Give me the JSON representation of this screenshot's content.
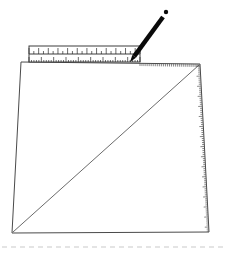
{
  "figure": {
    "title": "Perspective square construction with ruler and pencil",
    "caption": "",
    "background_color": "#ffffff",
    "width": 225,
    "height": 254
  },
  "colors": {
    "outline": "#4a4a4a",
    "diagonal": "#6b6b6b",
    "ruler_body": "#ffffff",
    "ruler_stroke": "#3d3d3d",
    "ruler_tick": "#2b2b2b",
    "pencil": "#0a0a0a",
    "edge_ticks": "#555555",
    "baseline_dash": "#c9c9c9"
  },
  "shapes": {
    "quadrilateral": {
      "label": "perspective-square",
      "points": [
        {
          "name": "top-left",
          "x": 21,
          "y": 62
        },
        {
          "name": "top-right",
          "x": 200,
          "y": 64
        },
        {
          "name": "bottom-right",
          "x": 209,
          "y": 232
        },
        {
          "name": "bottom-left",
          "x": 12,
          "y": 233
        }
      ],
      "stroke_width": 1
    },
    "diagonal": {
      "label": "corner-to-corner-diagonal",
      "from": {
        "name": "bottom-left",
        "x": 13,
        "y": 232
      },
      "to": {
        "name": "top-right",
        "x": 199,
        "y": 65
      },
      "stroke_width": 1
    },
    "baseline_dashes": {
      "label": "ground-line",
      "y": 247,
      "x_start": 2,
      "x_end": 223,
      "dash": "5 4",
      "stroke_width": 1
    }
  },
  "ruler": {
    "label": "ruler",
    "x": 29,
    "y": 46,
    "width": 111,
    "height": 16,
    "upper_scale": {
      "name": "upper-scale",
      "tick_count": 23,
      "major_every": 1,
      "tick_length_major": 6,
      "tick_length_minor": 3
    },
    "lower_scale": {
      "name": "lower-scale",
      "tick_count": 45,
      "tick_length_major": 5,
      "tick_length_minor": 2
    },
    "numbers_visible": false
  },
  "pencil": {
    "label": "pencil",
    "tip": {
      "x": 130,
      "y": 62
    },
    "butt": {
      "x": 163,
      "y": 17
    },
    "thickness": 4.5,
    "highlight_dot": {
      "x": 166,
      "y": 12,
      "r": 2.2
    }
  },
  "right_edge_scale": {
    "label": "right-edge-tick-scale",
    "from": {
      "x": 200,
      "y": 66
    },
    "to": {
      "x": 209,
      "y": 231
    },
    "tick_count": 82,
    "tick_length": 4
  },
  "top_edge_scale": {
    "label": "top-edge-tick-scale",
    "from": {
      "x": 140,
      "y": 63
    },
    "to": {
      "x": 199,
      "y": 64
    },
    "tick_count": 30,
    "tick_length": 3
  }
}
